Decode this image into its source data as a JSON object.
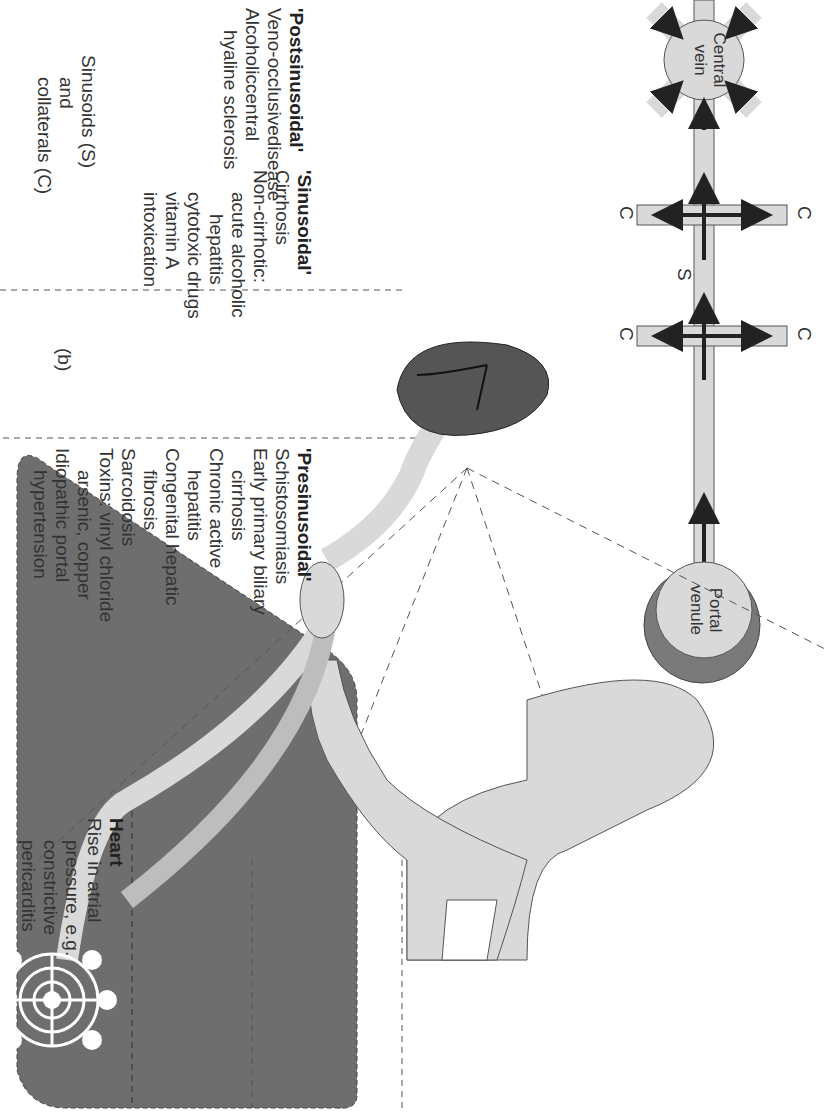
{
  "panel_b": {
    "label": "(b)",
    "post": {
      "title": "'Postsinusoidal'",
      "lines": [
        "Veno-occlusivedisease",
        "Alcoholiccentral",
        "hyaline sclerosis"
      ]
    },
    "sinus": {
      "title": "'Sinusoidal'",
      "lines": [
        "Cirrhosis",
        "Non-cirrhotic:",
        "acute alcoholic",
        "hepatitis",
        "cytotoxic drugs",
        "vitamin A",
        "intoxication"
      ]
    },
    "pre": {
      "title": "'Presinusoidal'",
      "lines": [
        "Schistosomiasis",
        "Early primary biliary",
        "cirrhosis",
        "Chronic active",
        "hepatitis",
        "Congenital hepatic",
        "fibrosis",
        "Sarcoidosis",
        "Toxins: vinyl chloride",
        "arsenic, copper",
        "Idiopathic portal",
        "hypertension"
      ]
    },
    "central_vein": [
      "Central",
      "vein"
    ],
    "portal_venule": [
      "Portal",
      "venule"
    ],
    "s_label": "S",
    "c_label": "C",
    "legend": [
      "Sinusoids (S)",
      "and",
      "collaterals (C)"
    ]
  },
  "panel_a": {
    "label": "(a)",
    "heart": {
      "title": "Heart",
      "lines": [
        "Rise in atrial",
        "pressure, e.g.",
        "constrictive",
        "pericarditis"
      ]
    },
    "ivc": {
      "title": "Inferior vena",
      "title2": "cava",
      "lines": [
        "Webs, tumor",
        "invasion,",
        "thrombosis"
      ]
    },
    "hepatic": {
      "title": "Hepatic veins",
      "lines": [
        "Large:",
        "thrombosis,",
        "web, tumor",
        "invasion"
      ]
    },
    "small": [
      "Small:",
      "veno-occlusive",
      "disease"
    ],
    "liver": "LIVER",
    "see_b": [
      "see (b)",
      "on right"
    ],
    "portal": {
      "title": [
        "Portal",
        "vein"
      ],
      "lines": [
        "Thrombosis",
        "Invasion or",
        "compression",
        "by tumor"
      ]
    },
    "splenic": {
      "title": [
        "Splenic",
        "vein"
      ],
      "lines": [
        "Thrombosis",
        "Invasion or",
        "compression",
        "by tumor"
      ]
    },
    "increased": {
      "title": [
        "Increased",
        "blood",
        "flow"
      ],
      "lines": [
        "Idiopathic",
        "tropical",
        "splenomegaly",
        "Arteriovenous",
        "fistula"
      ]
    }
  },
  "colors": {
    "vessel_fill": "#d9d9d9",
    "liver_fill": "#6e6e6e",
    "spleen_fill": "#555555",
    "venule_ring": "#7a7a7a",
    "text": "#333333"
  }
}
